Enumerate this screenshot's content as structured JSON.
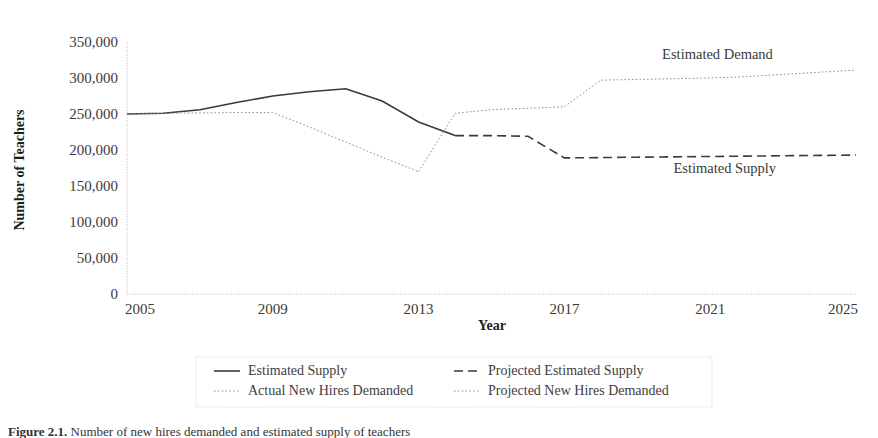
{
  "figure": {
    "caption_prefix": "Figure 2.1.",
    "caption_text": " Number of new hires demanded and estimated supply of teachers"
  },
  "chart_data": {
    "type": "line",
    "title": "",
    "xlabel": "Year",
    "ylabel": "Number of Teachers",
    "xlim": [
      2005,
      2025
    ],
    "ylim": [
      0,
      350000
    ],
    "x_ticks": [
      "2005",
      "2009",
      "2013",
      "2017",
      "2021",
      "2025"
    ],
    "x_tick_values": [
      2005,
      2009,
      2013,
      2017,
      2021,
      2025
    ],
    "y_ticks": [
      "0",
      "50,000",
      "100,000",
      "150,000",
      "200,000",
      "250,000",
      "300,000",
      "350,000"
    ],
    "y_tick_values": [
      0,
      50000,
      100000,
      150000,
      200000,
      250000,
      300000,
      350000
    ],
    "grid": false,
    "legend_position": "bottom",
    "series": [
      {
        "name": "Estimated Supply",
        "style": "solid",
        "color": "#3a3a3a",
        "x": [
          2005,
          2006,
          2007,
          2008,
          2009,
          2010,
          2011,
          2012,
          2013,
          2014
        ],
        "values": [
          250000,
          251000,
          256000,
          266000,
          275000,
          281000,
          285000,
          268000,
          239000,
          220000
        ]
      },
      {
        "name": "Projected Estimated Supply",
        "style": "dashed",
        "color": "#3a3a3a",
        "x": [
          2014,
          2015,
          2016,
          2017,
          2018,
          2019,
          2020,
          2021,
          2022,
          2023,
          2024,
          2025
        ],
        "values": [
          220000,
          220000,
          219000,
          189000,
          189500,
          190000,
          190500,
          191000,
          191500,
          192000,
          192500,
          193000
        ]
      },
      {
        "name": "Actual New Hires Demanded",
        "style": "dotted",
        "color": "#8e8e8e",
        "x": [
          2005,
          2006,
          2007,
          2008,
          2009,
          2010,
          2011,
          2012,
          2013
        ],
        "values": [
          250000,
          251000,
          251500,
          252000,
          252000,
          232000,
          211000,
          190000,
          170000
        ]
      },
      {
        "name": "Projected New Hires Demanded",
        "style": "dotted",
        "color": "#8e8e8e",
        "x": [
          2013,
          2014,
          2015,
          2016,
          2017,
          2018,
          2019,
          2020,
          2021,
          2022,
          2023,
          2024,
          2025
        ],
        "values": [
          170000,
          251000,
          256000,
          258000,
          260000,
          297000,
          298000,
          299000,
          300000,
          302000,
          305000,
          308000,
          311000
        ]
      }
    ],
    "annotations": [
      {
        "text": "Estimated Demand",
        "x": 2021.2,
        "y": 327000
      },
      {
        "text": "Estimated Supply",
        "x": 2021.4,
        "y": 168000
      }
    ]
  },
  "legend": {
    "entries": [
      {
        "label": "Estimated Supply",
        "style": "solid",
        "color": "#3a3a3a"
      },
      {
        "label": "Projected Estimated Supply",
        "style": "dashed",
        "color": "#3a3a3a"
      },
      {
        "label": "Actual New Hires Demanded",
        "style": "dotted",
        "color": "#8e8e8e"
      },
      {
        "label": "Projected New Hires Demanded",
        "style": "dotted",
        "color": "#8e8e8e"
      }
    ]
  }
}
